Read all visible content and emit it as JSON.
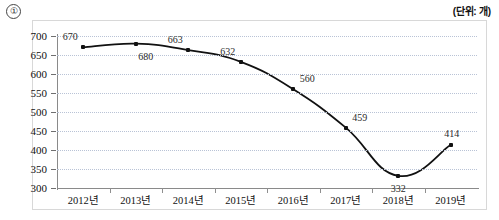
{
  "header": {
    "item_marker": "①",
    "unit_label": "(단위: 개)"
  },
  "chart_data": {
    "type": "line",
    "title": "",
    "subtitle": "",
    "xlabel": "",
    "ylabel": "",
    "unit": "개",
    "categories": [
      "2012년",
      "2013년",
      "2014년",
      "2015년",
      "2016년",
      "2017년",
      "2018년",
      "2019년"
    ],
    "values": [
      670,
      680,
      663,
      632,
      560,
      459,
      332,
      414
    ],
    "series": [
      {
        "name": "",
        "values": [
          670,
          680,
          663,
          632,
          560,
          459,
          332,
          414
        ]
      }
    ],
    "point_labels": [
      "670",
      "680",
      "663",
      "632",
      "560",
      "459",
      "332",
      "414"
    ],
    "label_positions": [
      "above-left",
      "below-right",
      "above-left",
      "above-left",
      "above-right",
      "above-right",
      "below",
      "above"
    ],
    "ylim": [
      300,
      700
    ],
    "ytick_step": 50,
    "ytick_labels": [
      "700",
      "650",
      "600",
      "550",
      "500",
      "450",
      "400",
      "350",
      "300"
    ],
    "ytick_values": [
      700,
      650,
      600,
      550,
      500,
      450,
      400,
      350,
      300
    ],
    "grid": true,
    "grid_style": "dotted",
    "legend": "none",
    "line_color": "#111111",
    "marker_color": "#111111",
    "grid_color": "#b9c3d6",
    "axis_color": "#8a8a8a",
    "frame_color": "#d8d8d8"
  }
}
